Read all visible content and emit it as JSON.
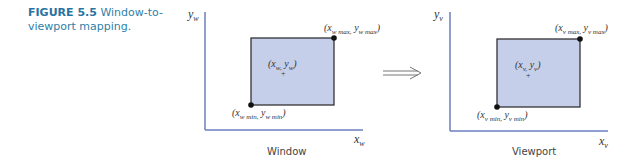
{
  "caption": {
    "number": "FIGURE 5.5",
    "text": "Window-to-viewport mapping."
  },
  "colors": {
    "axis": "#6b7fbd",
    "rect_fill": "#c6cfea",
    "rect_stroke": "#333333",
    "caption": "#2f7fa8"
  },
  "window": {
    "title": "Window",
    "y_axis": "y",
    "y_sub": "w",
    "x_axis": "x",
    "x_sub": "w",
    "max_point": "(x w max, y w max)",
    "min_point": "(x w min, y w min)",
    "inner_point": "(x w, y w)"
  },
  "viewport": {
    "title": "Viewport",
    "y_axis": "y",
    "y_sub": "v",
    "x_axis": "x",
    "x_sub": "v",
    "max_point": "(x v max, y v max)",
    "min_point": "(x v min, y v min)",
    "inner_point": "(x v, y v)"
  },
  "arrow": {
    "symbol": "⟹"
  }
}
